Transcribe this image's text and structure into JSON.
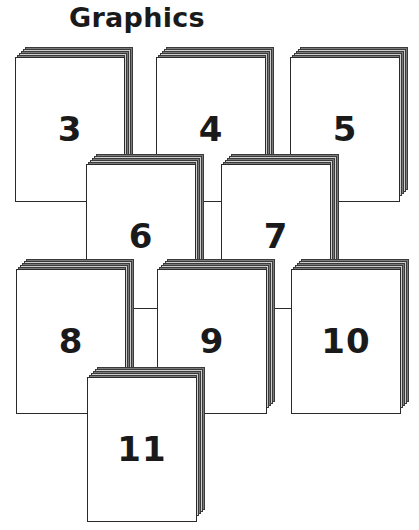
{
  "title": "Graphics",
  "colors": {
    "page_fill": "#ffffff",
    "page_outline": "#2a2a2a",
    "stack_shadow": "#7a7a7a",
    "text": "#1a1a1a"
  },
  "pages": [
    {
      "number": "3",
      "x": 15,
      "y": 47
    },
    {
      "number": "4",
      "x": 156,
      "y": 47
    },
    {
      "number": "5",
      "x": 290,
      "y": 47
    },
    {
      "number": "6",
      "x": 86,
      "y": 154
    },
    {
      "number": "7",
      "x": 221,
      "y": 154
    },
    {
      "number": "8",
      "x": 16,
      "y": 259
    },
    {
      "number": "9",
      "x": 157,
      "y": 259
    },
    {
      "number": "10",
      "x": 291,
      "y": 259
    },
    {
      "number": "11",
      "x": 87,
      "y": 367
    }
  ]
}
